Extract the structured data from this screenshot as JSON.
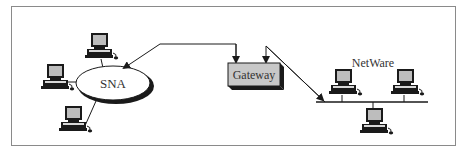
{
  "diagram": {
    "nodes": {
      "sna": {
        "label": "SNA"
      },
      "gateway": {
        "label": "Gateway"
      },
      "netware": {
        "label": "NetWare"
      }
    },
    "computers": {
      "sna_side": [
        "computer-top",
        "computer-left",
        "computer-bottom"
      ],
      "netware_side": [
        "computer-left",
        "computer-right",
        "computer-bottom"
      ]
    },
    "colors": {
      "border": "#8a8a8a",
      "line": "#1a1a1a",
      "gateway_fill": "#c8c8c8",
      "monitor_screen": "#bdbdbd"
    }
  }
}
